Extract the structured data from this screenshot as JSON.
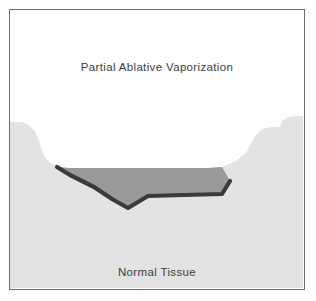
{
  "figure": {
    "type": "medical-cross-section-illustration",
    "subject": "Partial Ablative Vaporization",
    "labels": {
      "upper": "Partial Ablative Vaporization",
      "lower": "Normal Tissue"
    },
    "colors": {
      "background": "#ffffff",
      "frame_border": "#6e6e72",
      "normal_tissue": "#e3e3e3",
      "ablation_crater_fill": "#9a9a9a",
      "char_line": "#3a3a3a",
      "void": "#ffffff",
      "label_text": "#3c3c3c"
    },
    "regions": [
      {
        "name": "vaporized-void",
        "label": "Partial Ablative Vaporization",
        "fill": "#ffffff",
        "description": "White open area above the tissue surface representing vaporized/removed tissue"
      },
      {
        "name": "ablation-crater-zone",
        "label": "",
        "fill": "#9a9a9a",
        "description": "Medium gray residual ablation zone lining the crater floor"
      },
      {
        "name": "char-coagulation-line",
        "label": "",
        "fill": "#3a3a3a",
        "description": "Dark charcoal band marking the char / thermal coagulation boundary beneath the crater"
      },
      {
        "name": "normal-tissue",
        "label": "Normal Tissue",
        "fill": "#e3e3e3",
        "description": "Light gray untreated tissue filling the lower portion and both shoulders"
      }
    ],
    "geometry": {
      "tissue_surface_path": "M0,281 L0,112 L14,112 L20,116 L26,122 L30,131 L33,142 L37,150 L43,155 L50,158 L60,159 L200,159 L214,158 L228,152 L238,144 L247,127 L254,120 L262,118 L272,118 L274,112 L280,108 L290,107 L296,107 L296,281 Z",
      "crater_fill_path": "M50,158 L60,159 L200,159 L214,158 L222,172 L214,184 L140,186 L120,198 L104,190 L86,178 L62,166 Z",
      "char_line_path": "M48,158 L62,166 L86,178 L104,190 L120,199 L140,187 L214,185 L222,172",
      "char_line_width": 4.2
    }
  }
}
